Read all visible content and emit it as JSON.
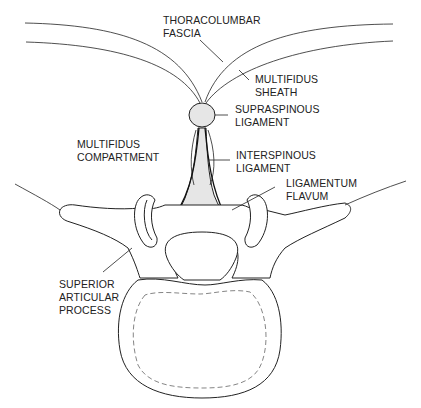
{
  "diagram": {
    "labels": {
      "thoracolumbar_fascia": [
        "THORACOLUMBAR",
        "FASCIA"
      ],
      "multifidus_sheath": [
        "MULTIFIDUS",
        "SHEATH"
      ],
      "supraspinous_ligament": [
        "SUPRASPINOUS",
        "LIGAMENT"
      ],
      "multifidus_compartment": [
        "MULTIFIDUS",
        "COMPARTMENT"
      ],
      "interspinous_ligament": [
        "INTERSPINOUS",
        "LIGAMENT"
      ],
      "ligamentum_flavum": [
        "LIGAMENTUM",
        "FLAVUM"
      ],
      "superior_articular_process": [
        "SUPERIOR",
        "ARTICULAR",
        "PROCESS"
      ]
    }
  }
}
